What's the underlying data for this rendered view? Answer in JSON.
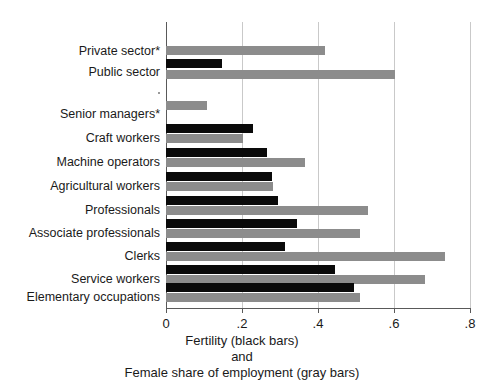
{
  "chart_data": {
    "type": "bar",
    "orientation": "horizontal",
    "title": "",
    "subtitle": "",
    "xlabel_lines": [
      "Fertility (black bars)",
      "and",
      "Female share of employment (gray bars)"
    ],
    "ylabel": "",
    "xlim": [
      0,
      0.8
    ],
    "xticks": [
      0,
      0.2,
      0.4,
      0.6,
      0.8
    ],
    "xtick_labels": [
      "0",
      ".2",
      ".4",
      ".6",
      ".8"
    ],
    "grid": true,
    "grid_axis": "x",
    "legend": "none",
    "legend_note": "Series identified in axis caption: black bars = Fertility, gray bars = Female share of employment",
    "categories": [
      "Private sector*",
      "Public sector",
      "Senior managers*",
      "Craft workers",
      "Machine operators",
      "Agricultural workers",
      "Professionals",
      "Associate professionals",
      "Clerks",
      "Service workers",
      "Elementary occupations"
    ],
    "group_gap_after": "Public sector",
    "series": [
      {
        "name": "Fertility (black bars)",
        "color": "#0a0a0a",
        "values": [
          null,
          0.147,
          null,
          0.229,
          0.266,
          0.279,
          0.295,
          0.345,
          0.313,
          0.445,
          0.495
        ]
      },
      {
        "name": "Female share of employment (gray bars)",
        "color": "#8c8c8c",
        "values": [
          0.418,
          0.603,
          0.108,
          0.203,
          0.366,
          0.282,
          0.532,
          0.511,
          0.734,
          0.682,
          0.511
        ]
      }
    ]
  },
  "axis": {
    "tick_labels": [
      "0",
      ".2",
      ".4",
      ".6",
      ".8"
    ],
    "caption_line1": "Fertility (black bars)",
    "caption_line2": "and",
    "caption_line3": "Female share of employment (gray bars)"
  },
  "colors": {
    "black_series": "#0a0a0a",
    "gray_series": "#8c8c8c",
    "grid": "#c9c9c9",
    "axis": "#595959",
    "background": "#ffffff"
  }
}
